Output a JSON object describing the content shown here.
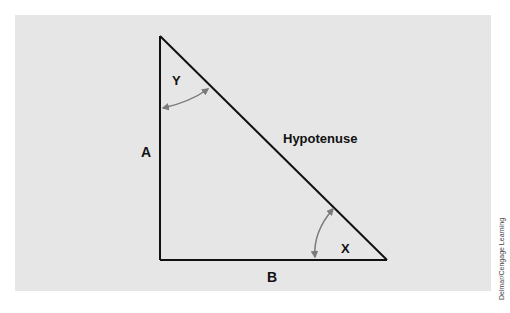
{
  "diagram": {
    "labels": {
      "side_vertical": "A",
      "side_horizontal": "B",
      "hypotenuse": "Hypotenuse",
      "angle_top": "Y",
      "angle_right": "X"
    },
    "colors": {
      "background": "#e6e6e6",
      "lines": "#111111",
      "arrows": "#7a7a7a"
    }
  },
  "credit": "Delmar/Cengage Learning"
}
